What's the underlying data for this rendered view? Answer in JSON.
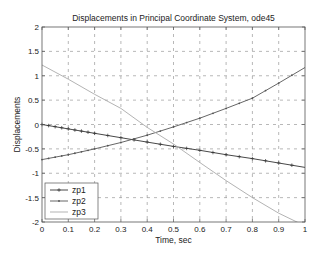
{
  "chart_data": {
    "type": "line",
    "title": "Displacements in Principal Coordinate System, ode45",
    "xlabel": "Time, sec",
    "ylabel": "Displacements",
    "xlim": [
      0,
      1
    ],
    "ylim": [
      -2,
      2
    ],
    "xticks": [
      0,
      0.1,
      0.2,
      0.3,
      0.4,
      0.5,
      0.6,
      0.7,
      0.8,
      0.9,
      1
    ],
    "xtick_labels": [
      "0",
      "0.1",
      "0.2",
      "0.3",
      "0.4",
      "0.5",
      "0.6",
      "0.7",
      "0.8",
      "0.9",
      "1"
    ],
    "yticks": [
      2,
      1.5,
      1,
      0.5,
      0,
      -0.5,
      -1,
      -1.5,
      -2
    ],
    "ytick_labels": [
      "2",
      "1.5",
      "1",
      "0.5",
      "0",
      "-0.5",
      "-1",
      "-1.5",
      "-2"
    ],
    "grid": true,
    "legend_position": "lower left",
    "x": [
      0,
      0.1,
      0.2,
      0.3,
      0.4,
      0.5,
      0.6,
      0.7,
      0.8,
      0.9,
      1.0
    ],
    "series": [
      {
        "name": "zp1",
        "marker": "+",
        "color": "#333333",
        "values": [
          0.0,
          -0.09,
          -0.18,
          -0.27,
          -0.36,
          -0.45,
          -0.53,
          -0.62,
          -0.7,
          -0.79,
          -0.88
        ]
      },
      {
        "name": "zp2",
        "marker": ".",
        "color": "#555555",
        "values": [
          -0.72,
          -0.62,
          -0.5,
          -0.37,
          -0.22,
          -0.05,
          0.13,
          0.33,
          0.54,
          0.85,
          1.17
        ]
      },
      {
        "name": "zp3",
        "marker": "none",
        "color": "#aaaaaa",
        "values": [
          1.22,
          0.93,
          0.62,
          0.33,
          -0.06,
          -0.4,
          -0.78,
          -1.15,
          -1.5,
          -1.82,
          -2.08
        ]
      }
    ]
  },
  "legend": {
    "items": [
      {
        "label": "zp1"
      },
      {
        "label": "zp2"
      },
      {
        "label": "zp3"
      }
    ]
  }
}
